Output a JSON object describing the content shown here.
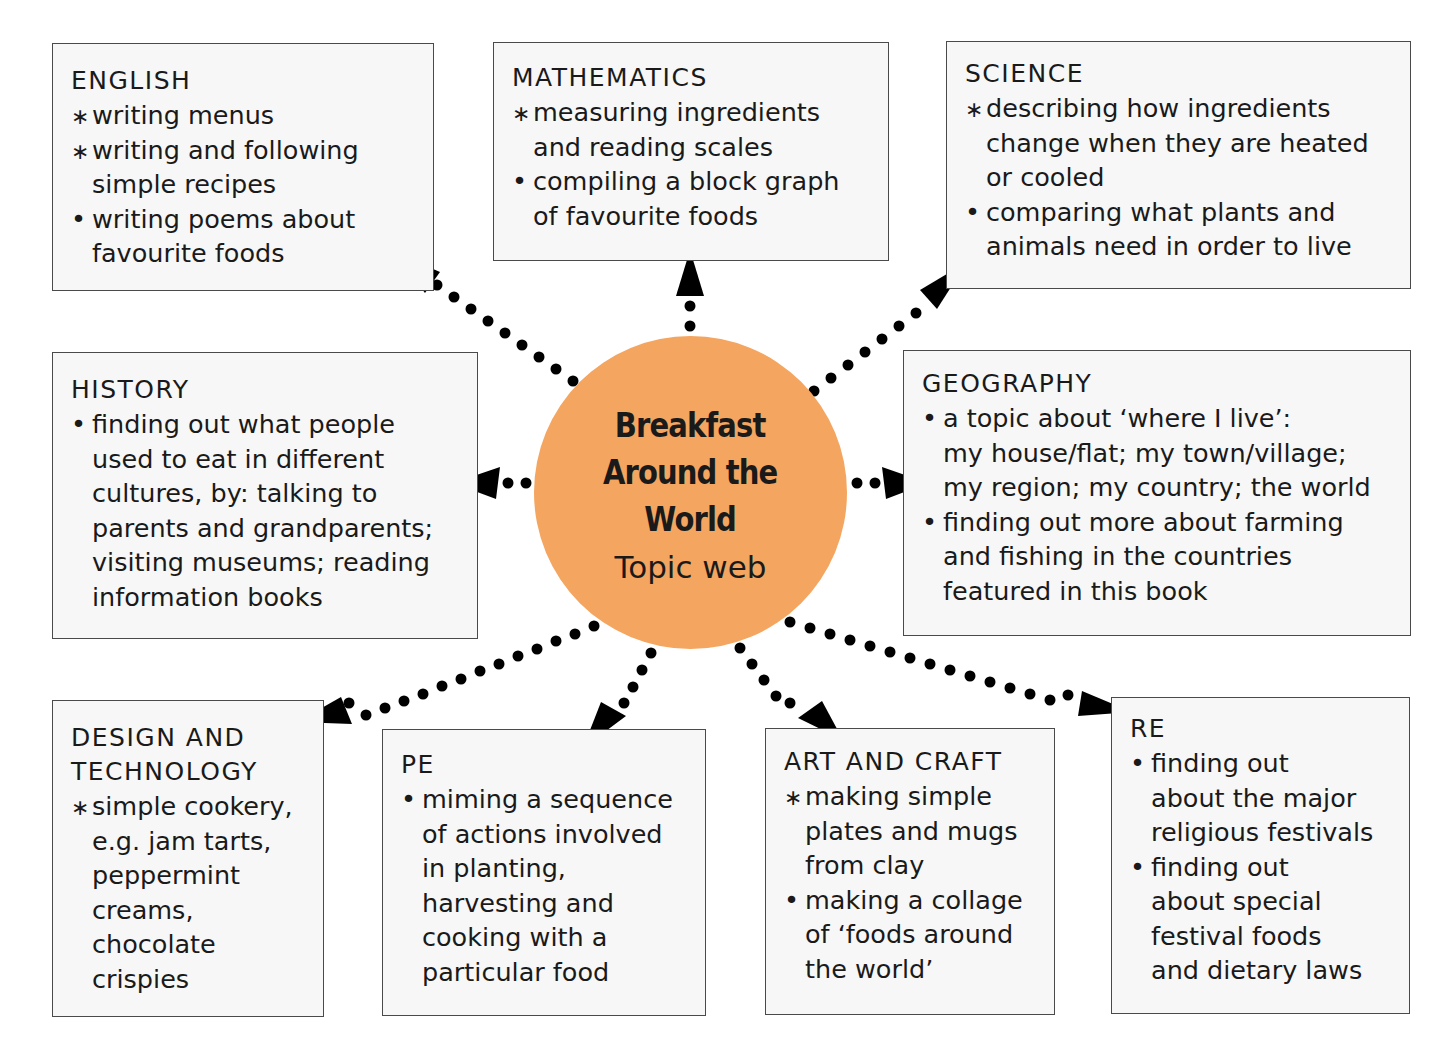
{
  "diagram": {
    "type": "topic-web",
    "colors": {
      "hub_fill": "#f4a55f",
      "box_fill": "#f7f7f7",
      "box_border": "#4a4a4a",
      "arrow": "#000000"
    },
    "hub": {
      "title": "Breakfast\nAround the\nWorld",
      "subtitle": "Topic web"
    },
    "boxes": {
      "english": {
        "title": "ENGLISH",
        "items": [
          {
            "marker": "star",
            "text": "writing menus"
          },
          {
            "marker": "star",
            "text": "writing and following\nsimple recipes"
          },
          {
            "marker": "bullet",
            "text": "writing poems about\nfavourite foods"
          }
        ]
      },
      "mathematics": {
        "title": "MATHEMATICS",
        "items": [
          {
            "marker": "star",
            "text": "measuring ingredients\nand reading scales"
          },
          {
            "marker": "bullet",
            "text": "compiling a block graph\nof favourite foods"
          }
        ]
      },
      "science": {
        "title": "SCIENCE",
        "items": [
          {
            "marker": "star",
            "text": "describing how ingredients\nchange when they are heated\nor cooled"
          },
          {
            "marker": "bullet",
            "text": "comparing what plants and\nanimals need in order to live"
          }
        ]
      },
      "history": {
        "title": "HISTORY",
        "items": [
          {
            "marker": "bullet",
            "text": "finding out what people\nused to eat in different\ncultures, by: talking to\nparents and grandparents;\nvisiting museums; reading\ninformation books"
          }
        ]
      },
      "geography": {
        "title": "GEOGRAPHY",
        "items": [
          {
            "marker": "bullet",
            "text": "a topic about ‘where I live’:\nmy house/flat; my town/village;\nmy region; my country; the world"
          },
          {
            "marker": "bullet",
            "text": "finding out more about farming\nand fishing in the countries\nfeatured in this book"
          }
        ]
      },
      "design_technology": {
        "title": "DESIGN AND\nTECHNOLOGY",
        "items": [
          {
            "marker": "star",
            "text": "simple cookery,\ne.g. jam tarts,\npeppermint\ncreams,\nchocolate\ncrispies"
          }
        ]
      },
      "pe": {
        "title": "PE",
        "items": [
          {
            "marker": "bullet",
            "text": "miming a sequence\nof actions involved\nin planting,\nharvesting and\ncooking with a\nparticular food"
          }
        ]
      },
      "art_craft": {
        "title": "ART AND CRAFT",
        "items": [
          {
            "marker": "star",
            "text": "making simple\nplates and mugs\nfrom clay"
          },
          {
            "marker": "bullet",
            "text": "making a collage\nof ‘foods around\nthe world’"
          }
        ]
      },
      "re": {
        "title": "RE",
        "items": [
          {
            "marker": "bullet",
            "text": "finding out\nabout the major\nreligious festivals"
          },
          {
            "marker": "bullet",
            "text": "finding out\nabout special\nfestival foods\nand dietary laws"
          }
        ]
      }
    }
  }
}
